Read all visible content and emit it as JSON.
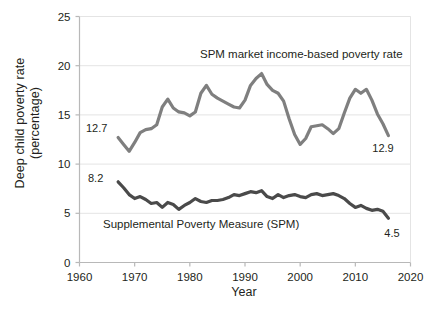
{
  "chart_data": {
    "type": "line",
    "title": "",
    "xlabel": "Year",
    "ylabel": "Deep child poverty rate (percentage)",
    "ylabel_line1": "Deep child poverty rate",
    "ylabel_line2": "(percentage)",
    "xlim": [
      1960,
      2020
    ],
    "ylim": [
      0,
      25
    ],
    "xticks": [
      1960,
      1970,
      1980,
      1990,
      2000,
      2010,
      2020
    ],
    "yticks": [
      0,
      5,
      10,
      15,
      20,
      25
    ],
    "grid": "horizontal",
    "legend_position": "inline-annotations",
    "series": [
      {
        "name": "SPM market income-based poverty rate",
        "color": "#7f7f7f",
        "label_text": "SPM market income-based poverty rate",
        "start_label": "12.7",
        "end_label": "12.9",
        "x": [
          1967,
          1968,
          1969,
          1970,
          1971,
          1972,
          1973,
          1974,
          1975,
          1976,
          1977,
          1978,
          1979,
          1980,
          1981,
          1982,
          1983,
          1984,
          1985,
          1986,
          1987,
          1988,
          1989,
          1990,
          1991,
          1992,
          1993,
          1994,
          1995,
          1996,
          1997,
          1998,
          1999,
          2000,
          2001,
          2002,
          2003,
          2004,
          2005,
          2006,
          2007,
          2008,
          2009,
          2010,
          2011,
          2012,
          2013,
          2014,
          2015,
          2016
        ],
        "values": [
          12.7,
          12.0,
          11.3,
          12.2,
          13.2,
          13.5,
          13.6,
          14.0,
          15.8,
          16.6,
          15.7,
          15.3,
          15.2,
          14.9,
          15.3,
          17.2,
          18.0,
          17.1,
          16.7,
          16.4,
          16.1,
          15.8,
          15.7,
          16.5,
          18.0,
          18.7,
          19.2,
          18.1,
          17.5,
          17.2,
          16.4,
          14.6,
          13.0,
          12.0,
          12.6,
          13.8,
          13.9,
          14.0,
          13.6,
          13.1,
          13.6,
          15.2,
          16.7,
          17.6,
          17.2,
          17.6,
          16.5,
          15.1,
          14.1,
          12.9
        ]
      },
      {
        "name": "Supplemental Poverty Measure (SPM)",
        "color": "#4a4a4a",
        "label_text": "Supplemental Poverty Measure (SPM)",
        "start_label": "8.2",
        "end_label": "4.5",
        "x": [
          1967,
          1968,
          1969,
          1970,
          1971,
          1972,
          1973,
          1974,
          1975,
          1976,
          1977,
          1978,
          1979,
          1980,
          1981,
          1982,
          1983,
          1984,
          1985,
          1986,
          1987,
          1988,
          1989,
          1990,
          1991,
          1992,
          1993,
          1994,
          1995,
          1996,
          1997,
          1998,
          1999,
          2000,
          2001,
          2002,
          2003,
          2004,
          2005,
          2006,
          2007,
          2008,
          2009,
          2010,
          2011,
          2012,
          2013,
          2014,
          2015,
          2016
        ],
        "values": [
          8.2,
          7.6,
          6.9,
          6.5,
          6.7,
          6.4,
          6.0,
          6.1,
          5.6,
          6.1,
          5.9,
          5.4,
          5.8,
          6.1,
          6.5,
          6.2,
          6.1,
          6.3,
          6.3,
          6.4,
          6.6,
          6.9,
          6.8,
          7.0,
          7.2,
          7.1,
          7.3,
          6.7,
          6.5,
          6.9,
          6.6,
          6.8,
          6.9,
          6.7,
          6.6,
          6.9,
          7.0,
          6.8,
          6.9,
          7.0,
          6.8,
          6.5,
          6.0,
          5.6,
          5.8,
          5.5,
          5.3,
          5.4,
          5.2,
          4.5
        ]
      }
    ]
  },
  "annotations": {
    "upper_series_label": "SPM market income-based poverty rate",
    "lower_series_label": "Supplemental Poverty Measure (SPM)",
    "upper_start_value": "12.7",
    "upper_end_value": "12.9",
    "lower_start_value": "8.2",
    "lower_end_value": "4.5"
  },
  "axes": {
    "x_title": "Year",
    "y_title_line1": "Deep child poverty rate",
    "y_title_line2": "(percentage)",
    "x_ticks": [
      "1960",
      "1970",
      "1980",
      "1990",
      "2000",
      "2010",
      "2020"
    ],
    "y_ticks": [
      "25",
      "20",
      "15",
      "10",
      "5",
      "0"
    ]
  },
  "colors": {
    "upper_line": "#7f7f7f",
    "lower_line": "#4a4a4a",
    "grid": "#e4e4e4",
    "axis": "#b8b8b8",
    "text": "#231f20"
  }
}
